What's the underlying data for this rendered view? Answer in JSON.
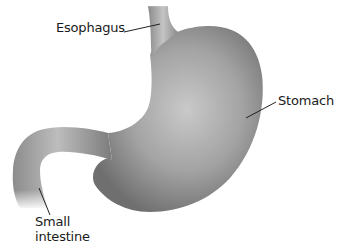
{
  "diagram": {
    "labels": {
      "esophagus": "Esophagus",
      "stomach": "Stomach",
      "small_intestine_line1": "Small",
      "small_intestine_line2": "intestine"
    },
    "colors": {
      "background": "#ffffff",
      "organ_light": "#c8c8c8",
      "organ_mid": "#9a9a9a",
      "organ_dark": "#6e6e6e",
      "leader_line": "#222222",
      "text": "#1a1a1a"
    }
  }
}
